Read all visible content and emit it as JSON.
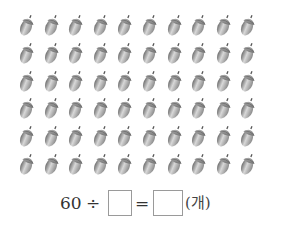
{
  "grid": {
    "rows": 6,
    "columns": 10,
    "item_icon": "acorn-icon",
    "item_count": 60,
    "origin_x": 18,
    "origin_y": 12,
    "step_x": 24.6,
    "step_y": 27.8
  },
  "equation": {
    "dividend": "60",
    "divide_sign": "÷",
    "divisor_value": "",
    "equals_sign": "=",
    "quotient_value": "",
    "unit": "(개)"
  }
}
